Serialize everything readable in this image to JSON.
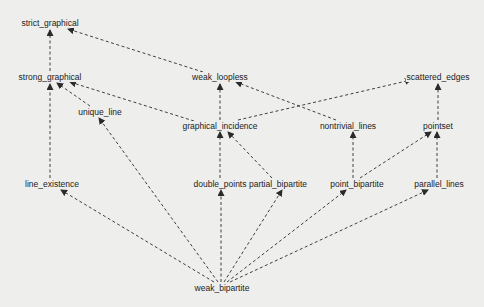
{
  "diagram": {
    "type": "directed-graph",
    "edge_style": "dashed",
    "colors": {
      "background": "#eeeeec",
      "edge": "#2a2a2a",
      "text": "#1c1c1c"
    },
    "nodes": [
      {
        "id": "strict_graphical",
        "label": "strict_graphical",
        "x": 50,
        "y": 23
      },
      {
        "id": "strong_graphical",
        "label": "strong_graphical",
        "x": 50,
        "y": 77
      },
      {
        "id": "weak_loopless",
        "label": "weak_loopless",
        "x": 220,
        "y": 77
      },
      {
        "id": "scattered_edges",
        "label": "scattered_edges",
        "x": 438,
        "y": 77
      },
      {
        "id": "unique_line",
        "label": "unique_line",
        "x": 100,
        "y": 112
      },
      {
        "id": "graphical_incidence",
        "label": "graphical_incidence",
        "x": 220,
        "y": 126
      },
      {
        "id": "nontrivial_lines",
        "label": "nontrivial_lines",
        "x": 348,
        "y": 126
      },
      {
        "id": "pointset",
        "label": "pointset",
        "x": 438,
        "y": 126
      },
      {
        "id": "line_existence",
        "label": "line_existence",
        "x": 52,
        "y": 184
      },
      {
        "id": "double_points",
        "label": "double_points",
        "x": 220,
        "y": 184
      },
      {
        "id": "partial_bipartite",
        "label": "partial_bipartite",
        "x": 278,
        "y": 184
      },
      {
        "id": "point_bipartite",
        "label": "point_bipartite",
        "x": 357,
        "y": 184
      },
      {
        "id": "parallel_lines",
        "label": "parallel_lines",
        "x": 439,
        "y": 184
      },
      {
        "id": "weak_bipartite",
        "label": "weak_bipartite",
        "x": 222,
        "y": 288
      }
    ],
    "edges": [
      {
        "from": "strong_graphical",
        "to": "strict_graphical",
        "x1": 50,
        "y1": 71,
        "x2": 50,
        "y2": 30
      },
      {
        "from": "weak_loopless",
        "to": "strict_graphical",
        "x1": 203,
        "y1": 72,
        "x2": 68,
        "y2": 29
      },
      {
        "from": "line_existence",
        "to": "strong_graphical",
        "x1": 50,
        "y1": 178,
        "x2": 50,
        "y2": 84
      },
      {
        "from": "unique_line",
        "to": "strong_graphical",
        "x1": 90,
        "y1": 106,
        "x2": 57,
        "y2": 83
      },
      {
        "from": "graphical_incidence",
        "to": "strong_graphical",
        "x1": 194,
        "y1": 121,
        "x2": 70,
        "y2": 82
      },
      {
        "from": "graphical_incidence",
        "to": "weak_loopless",
        "x1": 220,
        "y1": 120,
        "x2": 220,
        "y2": 84
      },
      {
        "from": "nontrivial_lines",
        "to": "weak_loopless",
        "x1": 336,
        "y1": 120,
        "x2": 236,
        "y2": 82
      },
      {
        "from": "graphical_incidence",
        "to": "scattered_edges",
        "x1": 238,
        "y1": 120,
        "x2": 411,
        "y2": 80
      },
      {
        "from": "pointset",
        "to": "scattered_edges",
        "x1": 438,
        "y1": 120,
        "x2": 438,
        "y2": 84
      },
      {
        "from": "double_points",
        "to": "graphical_incidence",
        "x1": 220,
        "y1": 178,
        "x2": 220,
        "y2": 132
      },
      {
        "from": "partial_bipartite",
        "to": "graphical_incidence",
        "x1": 272,
        "y1": 178,
        "x2": 228,
        "y2": 132
      },
      {
        "from": "point_bipartite",
        "to": "nontrivial_lines",
        "x1": 353,
        "y1": 178,
        "x2": 353,
        "y2": 132
      },
      {
        "from": "point_bipartite",
        "to": "pointset",
        "x1": 360,
        "y1": 178,
        "x2": 431,
        "y2": 132
      },
      {
        "from": "parallel_lines",
        "to": "pointset",
        "x1": 437,
        "y1": 178,
        "x2": 437,
        "y2": 132
      },
      {
        "from": "weak_bipartite",
        "to": "line_existence",
        "x1": 214,
        "y1": 282,
        "x2": 61,
        "y2": 190
      },
      {
        "from": "weak_bipartite",
        "to": "unique_line",
        "x1": 218,
        "y1": 282,
        "x2": 99,
        "y2": 118
      },
      {
        "from": "weak_bipartite",
        "to": "double_points",
        "x1": 221,
        "y1": 282,
        "x2": 221,
        "y2": 190
      },
      {
        "from": "weak_bipartite",
        "to": "partial_bipartite",
        "x1": 224,
        "y1": 282,
        "x2": 282,
        "y2": 190
      },
      {
        "from": "weak_bipartite",
        "to": "point_bipartite",
        "x1": 227,
        "y1": 282,
        "x2": 346,
        "y2": 190
      },
      {
        "from": "weak_bipartite",
        "to": "parallel_lines",
        "x1": 230,
        "y1": 282,
        "x2": 428,
        "y2": 190
      }
    ]
  }
}
